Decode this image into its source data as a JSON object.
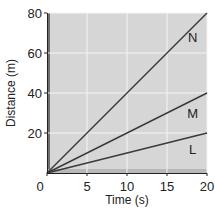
{
  "chart_data": {
    "type": "line",
    "title": "",
    "xlabel": "Time (s)",
    "ylabel": "Distance (m)",
    "xlim": [
      0,
      20
    ],
    "ylim": [
      0,
      80
    ],
    "x_ticks": [
      0,
      5,
      10,
      15,
      20
    ],
    "y_ticks": [
      20,
      40,
      60,
      80
    ],
    "x_tick_labels": [
      "0",
      "5",
      "10",
      "15",
      "20"
    ],
    "y_tick_labels": [
      "20",
      "40",
      "60",
      "80"
    ],
    "grid": true,
    "legend": "inline labels at right end of lines",
    "series": [
      {
        "name": "N",
        "x": [
          0,
          20
        ],
        "y": [
          0,
          80
        ],
        "label_pos": [
          18.2,
          68
        ]
      },
      {
        "name": "M",
        "x": [
          0,
          20
        ],
        "y": [
          0,
          40
        ],
        "label_pos": [
          18.2,
          30
        ]
      },
      {
        "name": "L",
        "x": [
          0,
          20
        ],
        "y": [
          0,
          20
        ],
        "label_pos": [
          18.2,
          12
        ]
      }
    ],
    "colors": {
      "plot_background": "#d6d6d6",
      "grid": "#f4f4f4",
      "line": "#3a3a3a",
      "axis_shadow": "#6e6e6e"
    }
  }
}
